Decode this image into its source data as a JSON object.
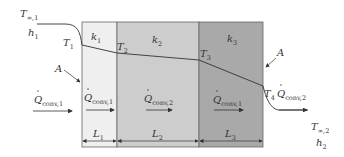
{
  "diagram": {
    "type": "composite-wall-heat-conduction",
    "layers": [
      {
        "conductivity": "k",
        "conductivity_sub": "1",
        "length": "L",
        "length_sub": "1",
        "color": "#efefef"
      },
      {
        "conductivity": "k",
        "conductivity_sub": "2",
        "length": "L",
        "length_sub": "2",
        "color": "#cdcdcd"
      },
      {
        "conductivity": "k",
        "conductivity_sub": "3",
        "length": "L",
        "length_sub": "3",
        "color": "#a9a9a9"
      }
    ],
    "temperatures": [
      {
        "label": "T",
        "sub": "1"
      },
      {
        "label": "T",
        "sub": "2"
      },
      {
        "label": "T",
        "sub": "3"
      },
      {
        "label": "T",
        "sub": "4"
      }
    ],
    "left_fluid": {
      "temp": "T",
      "temp_sub": "∞,1",
      "h": "h",
      "h_sub": "1"
    },
    "right_fluid": {
      "temp": "T",
      "temp_sub": "∞,2",
      "h": "h",
      "h_sub": "2"
    },
    "area_label": "A",
    "heat_flows": [
      {
        "label": "Q",
        "sub": "conv,1",
        "position": "left-fluid"
      },
      {
        "label": "Q",
        "sub": "conv,1",
        "position": "layer-1"
      },
      {
        "label": "Q",
        "sub": "conv,2",
        "position": "layer-2"
      },
      {
        "label": "Q",
        "sub": "conv,1",
        "position": "layer-3"
      },
      {
        "label": "Q",
        "sub": "conv,2",
        "position": "right-fluid"
      }
    ]
  }
}
